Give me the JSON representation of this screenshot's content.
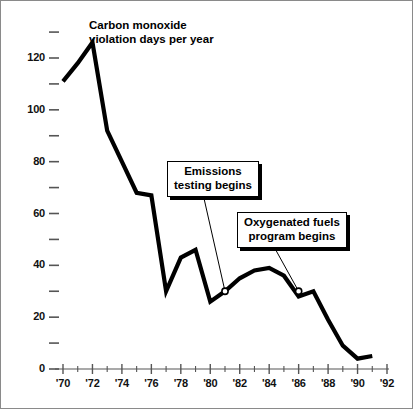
{
  "chart_data": {
    "type": "line",
    "title": "Carbon monoxide violation days per year",
    "xlabel": "",
    "ylabel": "",
    "xlim": [
      1969.5,
      1992.5
    ],
    "ylim": [
      0,
      130
    ],
    "grid": false,
    "legend": "none",
    "x_tick_labels": [
      "'70",
      "'72",
      "'74",
      "'76",
      "'78",
      "'80",
      "'82",
      "'84",
      "'86",
      "'88",
      "'90",
      "'92"
    ],
    "x_tick_values": [
      1970,
      1972,
      1974,
      1976,
      1978,
      1980,
      1982,
      1984,
      1986,
      1988,
      1990,
      1992
    ],
    "x_minor_tick_values": [
      1971,
      1973,
      1975,
      1977,
      1979,
      1981,
      1983,
      1985,
      1987,
      1989,
      1991
    ],
    "y_tick_labels": [
      "0",
      "20",
      "40",
      "60",
      "80",
      "100",
      "120"
    ],
    "y_tick_values": [
      0,
      20,
      40,
      60,
      80,
      100,
      120
    ],
    "y_minor_tick_values": [
      10,
      30,
      50,
      70,
      90,
      110,
      130
    ],
    "series": [
      {
        "name": "Carbon monoxide violation days per year",
        "color": "#000000",
        "x": [
          1970,
          1971,
          1972,
          1973,
          1974,
          1975,
          1976,
          1977,
          1978,
          1979,
          1980,
          1981,
          1982,
          1983,
          1984,
          1985,
          1986,
          1987,
          1988,
          1989,
          1990,
          1991
        ],
        "values": [
          111,
          118,
          126,
          92,
          80,
          68,
          67,
          30,
          43,
          46,
          26,
          30,
          35,
          38,
          39,
          36,
          28,
          30,
          19,
          9,
          4,
          5
        ]
      }
    ],
    "markers": [
      {
        "name": "emissions-testing-marker",
        "x": 1981,
        "y": 30,
        "style": "open-circle"
      },
      {
        "name": "oxygenated-fuels-marker",
        "x": 1986,
        "y": 30,
        "style": "open-circle"
      }
    ],
    "annotations": [
      {
        "id": "emissions",
        "line1": "Emissions",
        "line2": "testing begins",
        "points_to_x": 1981,
        "points_to_y": 30
      },
      {
        "id": "oxyfuel",
        "line1": "Oxygenated fuels",
        "line2": "program begins",
        "points_to_x": 1986,
        "points_to_y": 30
      }
    ]
  },
  "style": {
    "line_color": "#000000",
    "axis_color": "#555555",
    "background": "#ffffff",
    "border_color": "#8a8a8a"
  }
}
